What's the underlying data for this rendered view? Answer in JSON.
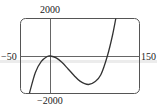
{
  "chart_data": {
    "type": "line",
    "title": "",
    "xlabel": "",
    "ylabel": "",
    "xlim": [
      -50,
      150
    ],
    "ylim": [
      -2000,
      2000
    ],
    "grid": false,
    "legend": null,
    "tick_labels": {
      "x_min": "−50",
      "x_max": "150",
      "y_max": "2000",
      "y_min": "−2000"
    },
    "series": [
      {
        "name": "f(x)",
        "description": "cubic with local max near (0, 0) and local min near (64, -1520), crossing x-axis near 96",
        "x": [
          -35,
          -25,
          -15,
          -5,
          0,
          10,
          20,
          30,
          40,
          50,
          64,
          75,
          85,
          96,
          105,
          112,
          118
        ],
        "y": [
          -1990,
          -880,
          -290,
          -29,
          0,
          -100,
          -350,
          -690,
          -1040,
          -1340,
          -1520,
          -1370,
          -1000,
          0,
          1160,
          2320,
          3350
        ]
      }
    ]
  },
  "colors": {
    "curve": "#333333",
    "frame": "#555555",
    "axes": "#666666",
    "text": "#222222",
    "band": "#ececec"
  }
}
